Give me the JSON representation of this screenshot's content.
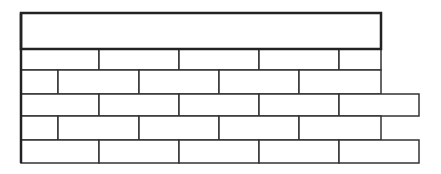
{
  "diagram": {
    "title": "",
    "colors": {
      "stroke": "#333333",
      "beam_stroke": "#222222",
      "fill": "#ffffff",
      "background": "#ffffff"
    },
    "beam": {
      "label": ""
    },
    "courses": [
      {
        "name": "course-1",
        "bricks": 5,
        "extends": false
      },
      {
        "name": "course-2",
        "bricks": 5,
        "extends": false
      },
      {
        "name": "course-3",
        "bricks": 5,
        "extends": true
      },
      {
        "name": "course-4",
        "bricks": 5,
        "extends": false
      },
      {
        "name": "course-5",
        "bricks": 5,
        "extends": true
      }
    ]
  }
}
